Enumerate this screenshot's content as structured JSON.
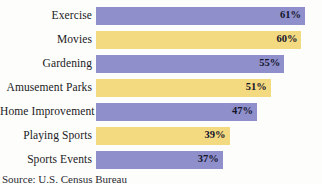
{
  "chart_data": {
    "type": "bar",
    "orientation": "horizontal",
    "title": "",
    "subtitle": "",
    "xlabel": "",
    "ylabel": "",
    "xlim": [
      0,
      66
    ],
    "grid": false,
    "legend": "none",
    "value_suffix": "%",
    "categories": [
      "Exercise",
      "Movies",
      "Gardening",
      "Amusement Parks",
      "Home Improvement",
      "Playing Sports",
      "Sports Events"
    ],
    "values": [
      61,
      60,
      55,
      51,
      47,
      39,
      37
    ],
    "value_labels": [
      "61%",
      "60%",
      "55%",
      "51%",
      "47%",
      "39%",
      "37%"
    ],
    "bar_colors": [
      "#8e8fcb",
      "#f3d97f",
      "#8e8fcb",
      "#f3d97f",
      "#8e8fcb",
      "#f3d97f",
      "#8e8fcb"
    ],
    "annotations": {
      "source": "Source: U.S. Census Bureau"
    }
  },
  "colors": {
    "bar_purple": "#8e8fcb",
    "bar_yellow": "#f3d97f",
    "label_text": "#1a1a24",
    "value_text": "#14142a",
    "background": "#fdfdfb"
  }
}
